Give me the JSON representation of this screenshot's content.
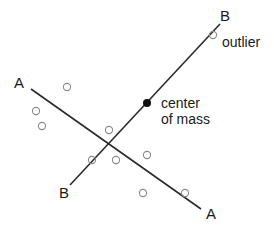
{
  "diagram": {
    "type": "principal-axes-scatter",
    "axis_a": {
      "label_start": "A",
      "label_end": "A",
      "from": [
        31,
        89
      ],
      "to": [
        201,
        209
      ]
    },
    "axis_b": {
      "label_start": "B",
      "label_end": "B",
      "from": [
        70,
        185
      ],
      "to": [
        220,
        24
      ]
    },
    "center_of_mass": {
      "label_line1": "center",
      "label_line2": "of mass",
      "position": [
        147,
        103
      ]
    },
    "outlier": {
      "label": "outlier",
      "position": [
        213,
        35
      ]
    },
    "points": [
      [
        67,
        87
      ],
      [
        36,
        111
      ],
      [
        42,
        126
      ],
      [
        109,
        130
      ],
      [
        92,
        160
      ],
      [
        116,
        160
      ],
      [
        147,
        155
      ],
      [
        143,
        193
      ],
      [
        185,
        193
      ]
    ],
    "colors": {
      "line": "#2a2a2a",
      "point_stroke": "#8a8a8a",
      "center_fill": "#111111",
      "text": "#1a1a1a"
    }
  }
}
